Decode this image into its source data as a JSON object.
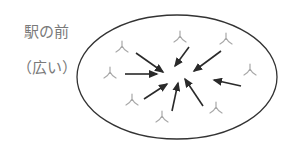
{
  "labels": {
    "place": "駅の前",
    "note": "（広い）"
  },
  "colors": {
    "text": "#7a7a7a",
    "ellipse_stroke": "#333333",
    "arrow": "#2a2a2a",
    "person": "#a8a8a8"
  },
  "ellipse": {
    "cx": 177,
    "cy": 77,
    "rx": 100,
    "ry": 62
  },
  "people": [
    {
      "x": 122,
      "y": 47
    },
    {
      "x": 180,
      "y": 37
    },
    {
      "x": 226,
      "y": 39
    },
    {
      "x": 110,
      "y": 73
    },
    {
      "x": 250,
      "y": 70
    },
    {
      "x": 132,
      "y": 100
    },
    {
      "x": 162,
      "y": 117
    },
    {
      "x": 216,
      "y": 108
    }
  ],
  "arrows": [
    {
      "x1": 136,
      "y1": 53,
      "x2": 163,
      "y2": 72
    },
    {
      "x1": 125,
      "y1": 74,
      "x2": 157,
      "y2": 74
    },
    {
      "x1": 189,
      "y1": 47,
      "x2": 175,
      "y2": 66
    },
    {
      "x1": 221,
      "y1": 51,
      "x2": 194,
      "y2": 71
    },
    {
      "x1": 241,
      "y1": 86,
      "x2": 214,
      "y2": 80
    },
    {
      "x1": 144,
      "y1": 99,
      "x2": 167,
      "y2": 84
    },
    {
      "x1": 172,
      "y1": 111,
      "x2": 178,
      "y2": 83
    },
    {
      "x1": 203,
      "y1": 106,
      "x2": 185,
      "y2": 79
    }
  ]
}
